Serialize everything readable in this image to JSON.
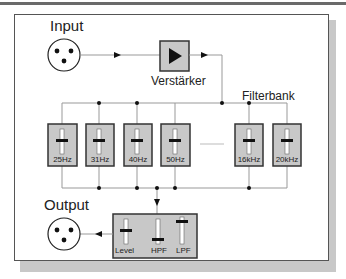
{
  "diagram": {
    "input_label": "Input",
    "output_label": "Output",
    "amplifier_label": "Verstärker",
    "filterbank_label": "Filterbank",
    "filters": [
      {
        "label": "25Hz"
      },
      {
        "label": "31Hz"
      },
      {
        "label": "40Hz"
      },
      {
        "label": "50Hz"
      },
      {
        "label": "16kHz"
      },
      {
        "label": "20kHz"
      }
    ],
    "output_controls": [
      {
        "label": "Level"
      },
      {
        "label": "HPF"
      },
      {
        "label": "LPF"
      }
    ],
    "colors": {
      "box_fill": "#c8c8c8",
      "box_border": "#333333",
      "line": "#999999",
      "dot": "#111111"
    }
  }
}
